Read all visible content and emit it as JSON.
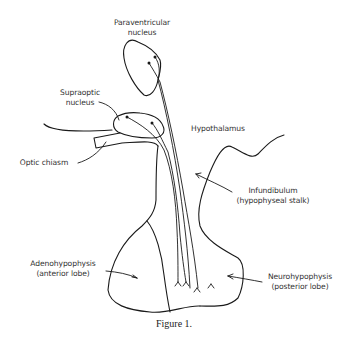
{
  "figure": {
    "caption": "Figure 1.",
    "labels": {
      "paraventricular": {
        "line1": "Paraventricular",
        "line2": "nucleus"
      },
      "supraoptic": {
        "line1": "Supraoptic",
        "line2": "nucleus"
      },
      "hypothalamus": {
        "line1": "Hypothalamus"
      },
      "optic_chiasm": {
        "line1": "Optic chiasm"
      },
      "infundibulum": {
        "line1": "Infundibulum",
        "line2": "(hypophyseal stalk)"
      },
      "adenohypophysis": {
        "line1": "Adenohypophysis",
        "line2": "(anterior lobe)"
      },
      "neurohypophysis": {
        "line1": "Neurohypophysis",
        "line2": "(posterior lobe)"
      }
    },
    "colors": {
      "line": "#1a1a1a",
      "text": "#333333",
      "background": "#ffffff"
    }
  }
}
